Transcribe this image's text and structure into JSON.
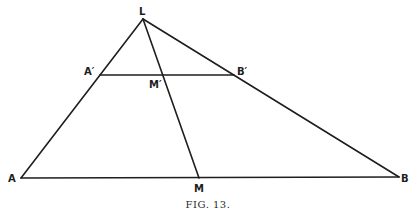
{
  "figure": {
    "caption": "FIG. 13.",
    "stroke_color": "#1e1e1e",
    "points": {
      "L": {
        "label": "L",
        "x": 143,
        "y": 19
      },
      "A": {
        "label": "A",
        "x": 21,
        "y": 178
      },
      "B": {
        "label": "B",
        "x": 399,
        "y": 177
      },
      "M": {
        "label": "M",
        "x": 199,
        "y": 178
      },
      "A1": {
        "label": "A′",
        "x": 100,
        "y": 75
      },
      "B1": {
        "label": "B′",
        "x": 234,
        "y": 75
      },
      "M1": {
        "label": "M′",
        "x": 162,
        "y": 75
      }
    },
    "segments": [
      {
        "name": "side-LA",
        "from": "L",
        "to": "A"
      },
      {
        "name": "side-LB",
        "from": "L",
        "to": "B"
      },
      {
        "name": "base-AB",
        "from": "A",
        "to": "B"
      },
      {
        "name": "median-LM",
        "from": "L",
        "to": "M"
      },
      {
        "name": "parallel-A1B1",
        "from": "A1",
        "to": "B1"
      }
    ]
  }
}
